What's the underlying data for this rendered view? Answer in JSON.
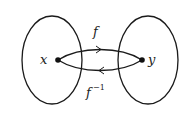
{
  "diagram": {
    "sets": [
      {
        "name": "domain",
        "element": "x"
      },
      {
        "name": "codomain",
        "element": "y"
      }
    ],
    "arrows": [
      {
        "label": "f",
        "from": "x",
        "to": "y"
      },
      {
        "label": "f",
        "superscript": "−1",
        "from": "y",
        "to": "x"
      }
    ],
    "colors": {
      "stroke": "#1a1a1a",
      "background": "#ffffff"
    }
  }
}
